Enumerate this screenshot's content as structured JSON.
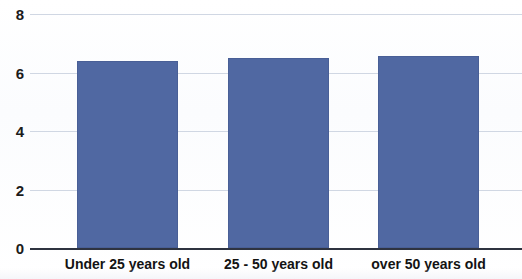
{
  "chart_data": {
    "type": "bar",
    "title": "",
    "subtitle": "",
    "xlabel": "",
    "ylabel": "",
    "categories": [
      "Under 25 years old",
      "25 - 50 years old",
      "over 50 years old"
    ],
    "values": [
      6.4,
      6.5,
      6.55
    ],
    "series": [
      {
        "name": "",
        "values": [
          6.4,
          6.5,
          6.55
        ]
      }
    ],
    "ylim": [
      0,
      8
    ],
    "xlim": null,
    "ytick_labels": [
      "0",
      "2",
      "4",
      "6",
      "8"
    ],
    "ytick_values": [
      0,
      2,
      4,
      6,
      8
    ],
    "grid": true,
    "grid_axis": "y",
    "legend": false,
    "legend_position": "none",
    "annotations": [],
    "colors": {
      "bar": "#5068a2",
      "gridline": "#c8d0de",
      "axis": "#2e3340",
      "background": "#f5f7fb",
      "tick_label": "#131313"
    }
  },
  "axes": {
    "y_ticks": [
      {
        "label": "8",
        "value": 8
      },
      {
        "label": "6",
        "value": 6
      },
      {
        "label": "4",
        "value": 4
      },
      {
        "label": "2",
        "value": 2
      },
      {
        "label": "0",
        "value": 0
      }
    ],
    "x_ticks": [
      {
        "label": "Under 25 years old"
      },
      {
        "label": "25 - 50 years old"
      },
      {
        "label": "over 50 years old"
      }
    ]
  }
}
